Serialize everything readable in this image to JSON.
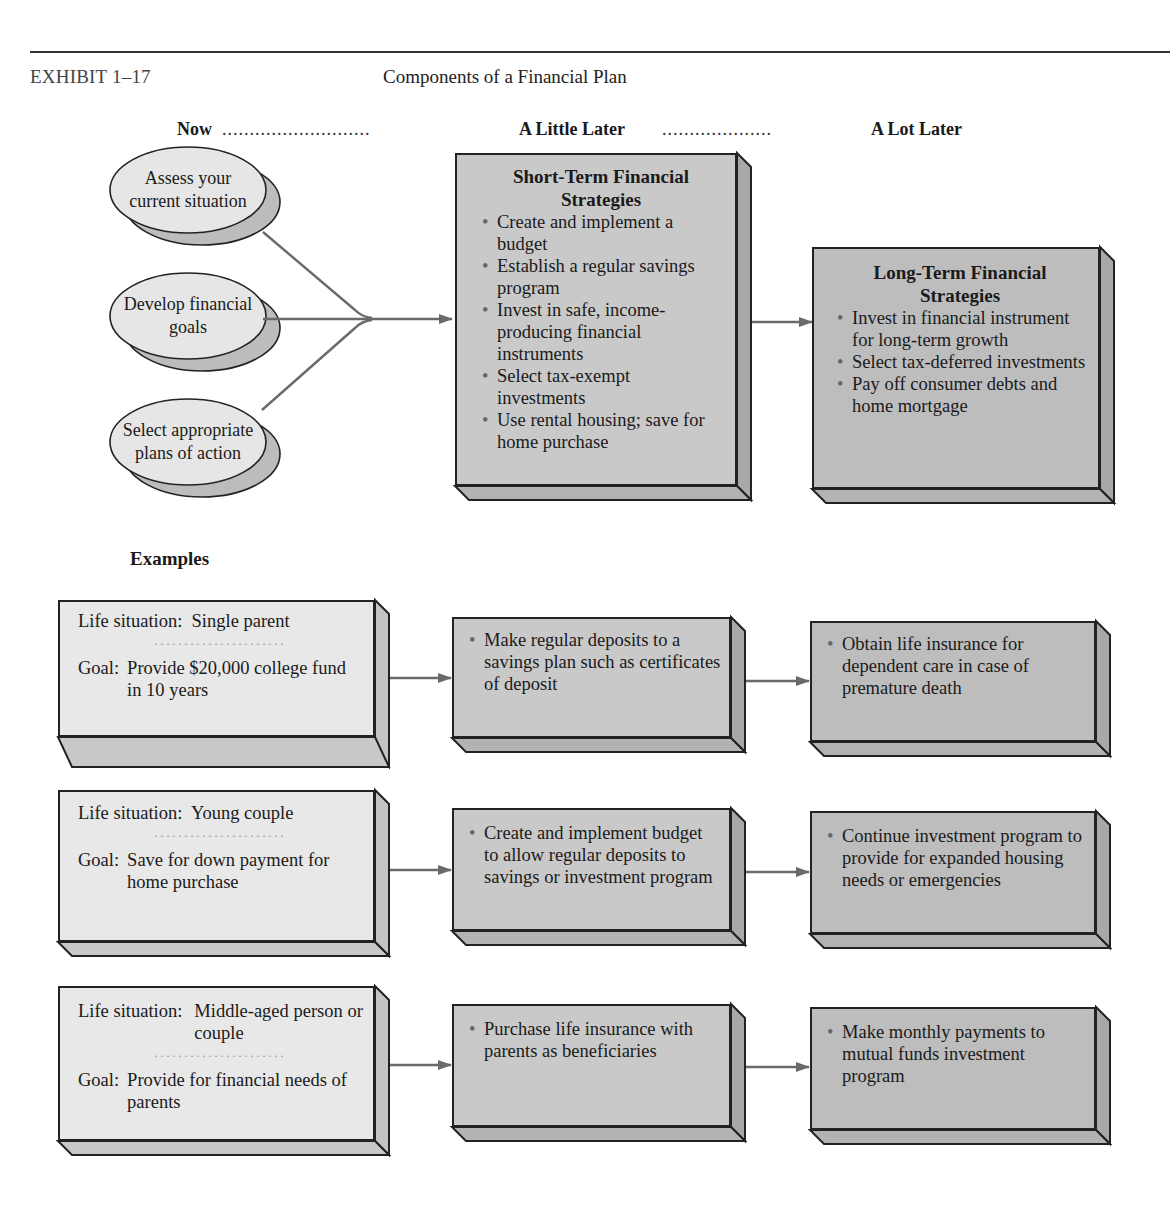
{
  "header": {
    "exhibit_label": "EXHIBIT 1–17",
    "title": "Components of a Financial Plan"
  },
  "timeline": {
    "now": "Now",
    "little_later": "A Little Later",
    "lot_later": "A Lot Later",
    "dots1": "...........................",
    "dots2": "...................."
  },
  "steps": [
    {
      "line1": "Assess your",
      "line2": "current situation"
    },
    {
      "line1": "Develop financial",
      "line2": "goals"
    },
    {
      "line1": "Select appropriate",
      "line2": "plans of action"
    }
  ],
  "short_term": {
    "title_line1": "Short-Term Financial",
    "title_line2": "Strategies",
    "items": [
      "Create and implement a budget",
      "Establish a regular savings program",
      "Invest in safe, income-producing financial instruments",
      "Select tax-exempt investments",
      "Use rental housing; save for home purchase"
    ]
  },
  "long_term": {
    "title_line1": "Long-Term Financial",
    "title_line2": "Strategies",
    "items": [
      "Invest in financial instrument for long-term growth",
      "Select tax-deferred investments",
      "Pay off consumer debts and home mortgage"
    ]
  },
  "examples": {
    "label": "Examples",
    "dotline": "......................",
    "rows": [
      {
        "situation_label": "Life situation:",
        "situation": "Single parent",
        "goal_label": "Goal:",
        "goal": "Provide $20,000 college fund in 10 years",
        "short_term": "Make regular deposits to a savings plan such as certificates of deposit",
        "long_term": "Obtain life insurance for dependent care in case of premature death"
      },
      {
        "situation_label": "Life situation:",
        "situation": "Young couple",
        "goal_label": "Goal:",
        "goal": "Save for down payment for home purchase",
        "short_term": "Create and implement budget to allow regular deposits to savings or investment program",
        "long_term": "Continue investment program to provide for expanded housing needs or emergencies"
      },
      {
        "situation_label": "Life situation:",
        "situation": "Middle-aged person or couple",
        "goal_label": "Goal:",
        "goal": "Provide for financial needs of parents",
        "short_term": "Purchase life insurance with parents as beneficiaries",
        "long_term": "Make monthly payments to mutual funds investment program"
      }
    ]
  },
  "colors": {
    "light_box": "#e8e8e8",
    "mid_box": "#c9c9c9",
    "dark_box": "#bdbdbd",
    "side_shade": "#a8a8a8",
    "ellipse_fill": "#e6e6e6",
    "ellipse_shadow": "#bcbcbc",
    "connector": "#6a6a6a",
    "outline": "#222222"
  }
}
